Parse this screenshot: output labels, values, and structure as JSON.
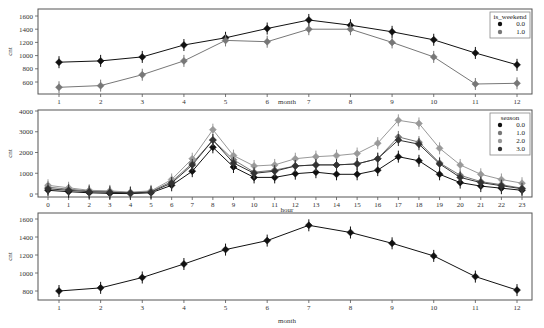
{
  "chart_data": [
    {
      "type": "line",
      "title": "",
      "xlabel": "month",
      "ylabel": "cnt",
      "x": [
        1,
        2,
        3,
        4,
        5,
        6,
        7,
        8,
        9,
        10,
        11,
        12
      ],
      "yticks": [
        600,
        800,
        1000,
        1200,
        1400,
        1600
      ],
      "ylim": [
        420,
        1660
      ],
      "grid": false,
      "legend": {
        "title": "is_weekend",
        "position": "upper right"
      },
      "series": [
        {
          "name": "0.0",
          "color": "#111111",
          "values": [
            900,
            920,
            980,
            1160,
            1270,
            1410,
            1540,
            1460,
            1360,
            1240,
            1040,
            860
          ]
        },
        {
          "name": "1.0",
          "color": "#777777",
          "values": [
            520,
            545,
            710,
            920,
            1230,
            1210,
            1400,
            1400,
            1200,
            980,
            570,
            580
          ]
        }
      ]
    },
    {
      "type": "line",
      "title": "",
      "xlabel": "hour",
      "ylabel": "cnt",
      "x": [
        0,
        1,
        2,
        3,
        4,
        5,
        6,
        7,
        8,
        9,
        10,
        11,
        12,
        13,
        14,
        15,
        16,
        17,
        18,
        19,
        20,
        21,
        22,
        23
      ],
      "yticks": [
        0,
        1000,
        2000,
        3000,
        4000
      ],
      "ylim": [
        -150,
        4000
      ],
      "grid": false,
      "legend": {
        "title": "season",
        "position": "upper right"
      },
      "series": [
        {
          "name": "0.0",
          "color": "#111111",
          "values": [
            180,
            110,
            60,
            30,
            20,
            60,
            420,
            1100,
            2250,
            1300,
            800,
            800,
            980,
            1050,
            950,
            950,
            1150,
            1800,
            1600,
            950,
            550,
            380,
            280,
            180
          ]
        },
        {
          "name": "1.0",
          "color": "#777777",
          "values": [
            330,
            230,
            150,
            120,
            60,
            120,
            600,
            1480,
            2600,
            1650,
            1050,
            1150,
            1350,
            1400,
            1400,
            1450,
            1700,
            2750,
            2500,
            1500,
            900,
            600,
            450,
            280
          ]
        },
        {
          "name": "2.0",
          "color": "#999999",
          "values": [
            420,
            300,
            180,
            150,
            90,
            150,
            700,
            1700,
            3100,
            1850,
            1350,
            1400,
            1700,
            1800,
            1850,
            1950,
            2450,
            3550,
            3400,
            2200,
            1400,
            950,
            700,
            520
          ]
        },
        {
          "name": "3.0",
          "color": "#333333",
          "values": [
            250,
            180,
            110,
            80,
            50,
            90,
            530,
            1400,
            2600,
            1500,
            1000,
            1100,
            1350,
            1400,
            1400,
            1450,
            1700,
            2600,
            2400,
            1450,
            800,
            550,
            400,
            250
          ]
        }
      ]
    },
    {
      "type": "line",
      "title": "",
      "xlabel": "month",
      "ylabel": "cnt",
      "x": [
        1,
        2,
        3,
        4,
        5,
        6,
        7,
        8,
        9,
        10,
        11,
        12
      ],
      "yticks": [
        800,
        1000,
        1200,
        1400,
        1600
      ],
      "ylim": [
        710,
        1660
      ],
      "grid": false,
      "series": [
        {
          "name": "cnt",
          "color": "#111111",
          "values": [
            800,
            835,
            950,
            1100,
            1260,
            1360,
            1530,
            1450,
            1330,
            1190,
            960,
            810
          ]
        }
      ]
    }
  ]
}
